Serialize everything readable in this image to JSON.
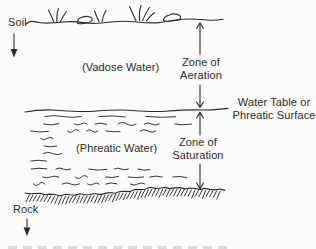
{
  "diagram": {
    "labels": {
      "soil": "Soil",
      "vadose_water": "(Vadose Water)",
      "zone_of_aeration": [
        "Zone of",
        "Aeration"
      ],
      "water_table": [
        "Water Table or",
        "Phreatic Surface"
      ],
      "phreatic_water": "(Phreatic Water)",
      "zone_of_saturation": [
        "Zone of",
        "Saturation"
      ],
      "rock": "Rock"
    },
    "colors": {
      "ink": "#2a2a2a",
      "background": "#fcfcfc"
    }
  }
}
